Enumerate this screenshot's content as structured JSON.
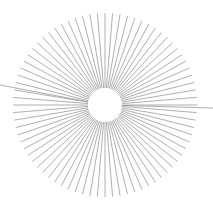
{
  "figure": {
    "name": "radial-burst",
    "type": "radial-line-burst",
    "title": "",
    "subtitle": "",
    "background_color": "#ffffff"
  },
  "canvas": {
    "width": 213,
    "height": 207
  },
  "chart_data": {
    "type": "scatter",
    "title": "",
    "subtitle": "",
    "xlabel": "",
    "ylabel": "",
    "grid": false,
    "legend": null,
    "legend_position": "none",
    "annotations": [],
    "geometry": {
      "center_x": 105,
      "center_y": 105,
      "inner_radius": 17,
      "outer_radius": 92,
      "ray_count": 76,
      "angle_step_deg": 4.7368,
      "start_angle_deg": 0
    },
    "style": {
      "ray_color": "#8c8c8c",
      "ray_width": 0.7,
      "hole_fill": "#ffffff",
      "background": "#ffffff"
    },
    "overshoot_rays": [
      {
        "label": "left-overshoot",
        "angle_deg": 184.5,
        "end_x": 0,
        "end_y": 85,
        "radius": 105
      },
      {
        "label": "right-overshoot",
        "angle_deg": 1.6,
        "end_x": 213,
        "end_y": 108,
        "radius": 108
      }
    ],
    "categories": [],
    "values": []
  }
}
